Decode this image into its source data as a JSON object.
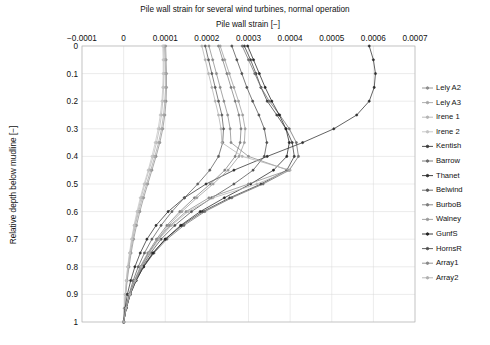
{
  "figure": {
    "title": "Pile wall strain for several wind turbines, normal operation",
    "xlabel": "Pile wall strain [−]",
    "ylabel": "Relative depth below mudline [−]",
    "background": "#ffffff",
    "grid_color": "#d8d8d8",
    "frame_color": "#b9b9b9"
  },
  "chart_data": {
    "type": "line",
    "title": "Pile wall strain for several wind turbines, normal operation",
    "xlabel": "Pile wall strain [−]",
    "ylabel": "Relative depth below mudline [−]",
    "xlim": [
      -0.0001,
      0.0007
    ],
    "ylim": [
      0,
      1
    ],
    "y_inverted": true,
    "grid": true,
    "legend_position": "right-outside",
    "xticks": [
      -0.0001,
      0,
      0.0001,
      0.0002,
      0.0003,
      0.0004,
      0.0005,
      0.0006,
      0.0007
    ],
    "xticklabels": [
      "−0.0001",
      "0",
      "0.0001",
      "0.0002",
      "0.0003",
      "0.0004",
      "0.0005",
      "0.0006",
      "0.0007"
    ],
    "yticks": [
      0,
      0.1,
      0.2,
      0.3,
      0.4,
      0.5,
      0.6,
      0.7,
      0.8,
      0.9,
      1
    ],
    "yticklabels": [
      "0",
      "0.1",
      "0.2",
      "0.3",
      "0.4",
      "0.5",
      "0.6",
      "0.7",
      "0.8",
      "0.9",
      "1"
    ],
    "y": [
      0,
      0.05,
      0.1,
      0.15,
      0.2,
      0.25,
      0.3,
      0.35,
      0.4,
      0.45,
      0.5,
      0.55,
      0.6,
      0.65,
      0.7,
      0.75,
      0.8,
      0.85,
      0.9,
      0.95,
      1
    ],
    "series": [
      {
        "name": "Lely A2",
        "color": "#8d8d8d",
        "marker": "circle",
        "values": [
          0.000101,
          0.000102,
          0.000103,
          0.000103,
          0.000102,
          9.9e-05,
          9.4e-05,
          8.7e-05,
          7.8e-05,
          6.8e-05,
          5.8e-05,
          4.8e-05,
          3.9e-05,
          3.1e-05,
          2.4e-05,
          1.8e-05,
          1.3e-05,
          8.5e-06,
          5e-06,
          2.2e-06,
          0.0
        ]
      },
      {
        "name": "Lely A3",
        "color": "#a6a6a6",
        "marker": "circle",
        "values": [
          9.8e-05,
          0.0001,
          0.000101,
          0.000101,
          9.9e-05,
          9.6e-05,
          9.1e-05,
          8.4e-05,
          7.5e-05,
          6.5e-05,
          5.5e-05,
          4.5e-05,
          3.6e-05,
          2.8e-05,
          2.2e-05,
          1.6e-05,
          1.1e-05,
          7.4e-06,
          4.3e-06,
          1.9e-06,
          0.0
        ]
      },
      {
        "name": "Irene 1",
        "color": "#b5b5b5",
        "marker": "circle",
        "values": [
          9.6e-05,
          9.7e-05,
          9.7e-05,
          9.6e-05,
          9.4e-05,
          9.1e-05,
          8.6e-05,
          7.9e-05,
          7.1e-05,
          6.1e-05,
          5.1e-05,
          4.2e-05,
          3.4e-05,
          2.6e-05,
          2e-05,
          1.5e-05,
          1e-05,
          6.8e-06,
          4e-06,
          1.8e-06,
          0.0
        ]
      },
      {
        "name": "Irene 2",
        "color": "#c4c4c4",
        "marker": "circle",
        "values": [
          9.4e-05,
          9.5e-05,
          9.5e-05,
          9.4e-05,
          9.2e-05,
          8.8e-05,
          8.3e-05,
          7.6e-05,
          6.8e-05,
          5.9e-05,
          4.9e-05,
          4e-05,
          3.2e-05,
          2.5e-05,
          1.9e-05,
          1.4e-05,
          9.5e-06,
          6.3e-06,
          3.7e-06,
          1.6e-06,
          0.0
        ]
      },
      {
        "name": "Kentish",
        "color": "#3a3a3a",
        "marker": "circle",
        "values": [
          0.00029,
          0.000305,
          0.000318,
          0.00033,
          0.000345,
          0.000368,
          0.00039,
          0.000405,
          0.00041,
          0.000392,
          0.00033,
          0.000255,
          0.00019,
          0.00014,
          0.0001,
          7e-05,
          4.6e-05,
          2.8e-05,
          1.5e-05,
          6e-06,
          0.0
        ]
      },
      {
        "name": "Barrow",
        "color": "#6b6b6b",
        "marker": "circle",
        "values": [
          0.000285,
          0.0003,
          0.000315,
          0.00033,
          0.00035,
          0.000375,
          0.000398,
          0.000415,
          0.00042,
          0.000398,
          0.000335,
          0.00026,
          0.000195,
          0.000145,
          0.000104,
          7.3e-05,
          4.8e-05,
          3e-05,
          1.6e-05,
          6.5e-06,
          0.0
        ]
      },
      {
        "name": "Thanet",
        "color": "#2e2e2e",
        "marker": "circle",
        "values": [
          0.00059,
          0.0006,
          0.000605,
          0.000602,
          0.00059,
          0.00056,
          0.000505,
          0.00043,
          0.000345,
          0.000265,
          0.000198,
          0.000146,
          0.000107,
          7.8e-05,
          5.6e-05,
          4e-05,
          2.7e-05,
          1.7e-05,
          9e-06,
          3.5e-06,
          0.0
        ]
      },
      {
        "name": "Belwind",
        "color": "#5a5a5a",
        "marker": "circle",
        "values": [
          0.000196,
          0.000204,
          0.000212,
          0.00022,
          0.000228,
          0.000236,
          0.00024,
          0.000238,
          0.000228,
          0.000207,
          0.000178,
          0.000146,
          0.000116,
          9e-05,
          6.8e-05,
          5e-05,
          3.5e-05,
          2.3e-05,
          1.3e-05,
          5.2e-06,
          0.0
        ]
      },
      {
        "name": "BurboB",
        "color": "#7d7d7d",
        "marker": "circle",
        "values": [
          0.000228,
          0.000238,
          0.000248,
          0.000258,
          0.000268,
          0.000277,
          0.000282,
          0.00028,
          0.000268,
          0.000243,
          0.000208,
          0.00017,
          0.000135,
          0.000104,
          7.9e-05,
          5.8e-05,
          4e-05,
          2.6e-05,
          1.5e-05,
          5.8e-06,
          0.0
        ]
      },
      {
        "name": "Walney",
        "color": "#9a9a9a",
        "marker": "circle",
        "values": [
          0.000232,
          0.000243,
          0.000254,
          0.000265,
          0.000276,
          0.000286,
          0.000292,
          0.00029,
          0.000277,
          0.000251,
          0.000215,
          0.000176,
          0.00014,
          0.000108,
          8.2e-05,
          6e-05,
          4.2e-05,
          2.7e-05,
          1.5e-05,
          6e-06,
          0.0
        ]
      },
      {
        "name": "GunfS",
        "color": "#242424",
        "marker": "circle",
        "values": [
          0.000298,
          0.000312,
          0.000326,
          0.00034,
          0.000356,
          0.000374,
          0.00039,
          0.000398,
          0.000392,
          0.00036,
          0.000305,
          0.000242,
          0.000184,
          0.000137,
          0.0001,
          7.1e-05,
          4.8e-05,
          3e-05,
          1.6e-05,
          6.5e-06,
          0.0
        ]
      },
      {
        "name": "HornsR",
        "color": "#4f4f4f",
        "marker": "circle",
        "values": [
          0.00026,
          0.000272,
          0.000284,
          0.000296,
          0.00031,
          0.000325,
          0.000338,
          0.000344,
          0.000338,
          0.000311,
          0.000265,
          0.000212,
          0.000163,
          0.000123,
          9e-05,
          6.5e-05,
          4.4e-05,
          2.8e-05,
          1.5e-05,
          6e-06,
          0.0
        ]
      },
      {
        "name": "Array1",
        "color": "#8a8a8a",
        "marker": "circle",
        "values": [
          0.000205,
          0.000214,
          0.000223,
          0.000232,
          0.000241,
          0.00025,
          0.000256,
          0.000258,
          0.0003,
          0.000395,
          0.0003,
          0.000205,
          0.00015,
          0.000112,
          8.3e-05,
          6e-05,
          4.2e-05,
          2.7e-05,
          1.5e-05,
          5.8e-06,
          0.0
        ]
      },
      {
        "name": "Array2",
        "color": "#b0b0b0",
        "marker": "circle",
        "values": [
          0.000188,
          0.000196,
          0.000204,
          0.000212,
          0.00022,
          0.000228,
          0.000234,
          0.000236,
          0.000285,
          0.0004,
          0.00032,
          0.000215,
          0.000155,
          0.000115,
          8.5e-05,
          6.2e-05,
          4.3e-05,
          2.8e-05,
          1.5e-05,
          5.8e-06,
          0.0
        ]
      }
    ]
  },
  "legend": {
    "items": [
      {
        "label": "Lely A2"
      },
      {
        "label": "Lely A3"
      },
      {
        "label": "Irene 1"
      },
      {
        "label": "Irene 2"
      },
      {
        "label": "Kentish"
      },
      {
        "label": "Barrow"
      },
      {
        "label": "Thanet"
      },
      {
        "label": "Belwind"
      },
      {
        "label": "BurboB"
      },
      {
        "label": "Walney"
      },
      {
        "label": "GunfS"
      },
      {
        "label": "HornsR"
      },
      {
        "label": "Array1"
      },
      {
        "label": "Array2"
      }
    ]
  }
}
